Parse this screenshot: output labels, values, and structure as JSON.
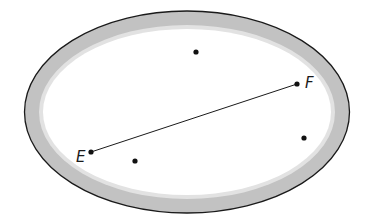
{
  "diagram": {
    "type": "geometry-region",
    "canvas": {
      "width": 371,
      "height": 222,
      "background": "#ffffff"
    },
    "region": {
      "shape": "ellipse",
      "cx": 187,
      "cy": 112,
      "rx": 162.5,
      "ry": 101,
      "outline_color": "#1a1a1a",
      "band_color": "#c2c2c2",
      "band_width": 17,
      "interior_color": "#ffffff"
    },
    "points": [
      {
        "id": "top",
        "label": "",
        "x": 196,
        "y": 52
      },
      {
        "id": "F",
        "label": "F",
        "x": 297,
        "y": 84,
        "label_x": 305,
        "label_y": 88
      },
      {
        "id": "E",
        "label": "E",
        "x": 91,
        "y": 152,
        "label_x": 77,
        "label_y": 162
      },
      {
        "id": "bottom-left",
        "label": "",
        "x": 135,
        "y": 161
      },
      {
        "id": "right",
        "label": "",
        "x": 304,
        "y": 138
      }
    ],
    "segments": [
      {
        "from": "E",
        "to": "F",
        "x1": 91,
        "y1": 152,
        "x2": 297,
        "y2": 84,
        "color": "#1a1a1a"
      }
    ],
    "labels": {
      "E": "E",
      "F": "F"
    }
  }
}
